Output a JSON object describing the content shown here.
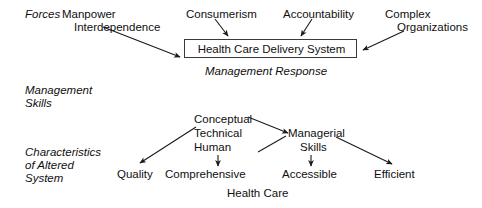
{
  "diagram": {
    "row_labels": {
      "forces": "Forces",
      "management_skills_line1": "Management",
      "management_skills_line2": "Skills",
      "characteristics_line1": "Characteristics",
      "characteristics_line2": "of Altered",
      "characteristics_line3": "System"
    },
    "forces": [
      {
        "line1": "Manpower",
        "line2": "Interdependence"
      },
      {
        "line1": "Consumerism",
        "line2": ""
      },
      {
        "line1": "Accountability",
        "line2": ""
      },
      {
        "line1": "Complex",
        "line2": "Organizations"
      }
    ],
    "central_box": {
      "label": "Health Care Delivery System"
    },
    "management_response": "Management Response",
    "skills": {
      "list": [
        "Conceptual",
        "Technical",
        "Human"
      ],
      "managerial_line1": "Managerial",
      "managerial_line2": "Skills"
    },
    "outcomes": [
      "Quality",
      "Comprehensive",
      "Accessible",
      "Efficient"
    ],
    "outcome_footer": "Health Care",
    "colors": {
      "ink": "#0f0f0f",
      "box_border": "#3a3a3a",
      "arrow": "#1a1a1a",
      "background": "#ffffff"
    }
  }
}
